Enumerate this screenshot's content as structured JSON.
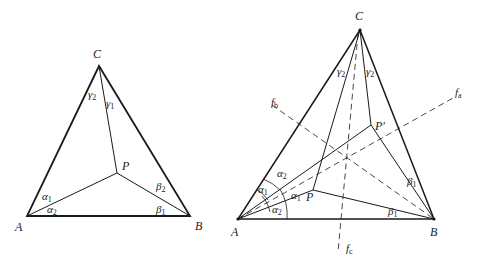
{
  "figure_left": {
    "title": "Triangle ABC with interior point P",
    "vertices": {
      "A": "A",
      "B": "B",
      "C": "C",
      "P": "P"
    },
    "angles": {
      "alpha1": {
        "sym": "α",
        "sub": "1"
      },
      "alpha2": {
        "sym": "α",
        "sub": "2"
      },
      "beta1": {
        "sym": "β",
        "sub": "1"
      },
      "beta2": {
        "sym": "β",
        "sub": "2"
      },
      "gamma1": {
        "sym": "γ",
        "sub": "1"
      },
      "gamma2": {
        "sym": "γ",
        "sub": "2"
      }
    }
  },
  "figure_right": {
    "title": "Triangle ABC with points P and reflected P' and angle bisectors",
    "vertices": {
      "A": "A",
      "B": "B",
      "C": "C",
      "P": "P",
      "P_prime": "P′"
    },
    "lines": {
      "fa": {
        "sym": "f",
        "sub": "a"
      },
      "fb": {
        "sym": "f",
        "sub": "b"
      },
      "fc": {
        "sym": "f",
        "sub": "c"
      }
    },
    "angles": {
      "alpha1_a": {
        "sym": "α",
        "sub": "1"
      },
      "alpha1_b": {
        "sym": "α",
        "sub": "1"
      },
      "alpha2_a": {
        "sym": "α",
        "sub": "2"
      },
      "alpha2_b": {
        "sym": "α",
        "sub": "2"
      },
      "beta1_a": {
        "sym": "β",
        "sub": "1"
      },
      "beta1_b": {
        "sym": "β",
        "sub": "1"
      },
      "gamma2_a": {
        "sym": "γ",
        "sub": "2"
      },
      "gamma2_b": {
        "sym": "γ",
        "sub": "2"
      }
    }
  }
}
